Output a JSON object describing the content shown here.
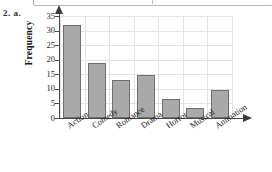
{
  "problem_label": "2. a.",
  "chart_data": {
    "type": "bar",
    "title": "",
    "xlabel": "",
    "ylabel": "Frequency",
    "categories": [
      "Action",
      "Comedy",
      "Romance",
      "Drama",
      "Horror",
      "Musical",
      "Animation"
    ],
    "values": [
      32,
      19,
      13,
      14.8,
      6.5,
      3.5,
      9.6
    ],
    "ylim": [
      0,
      35
    ],
    "ytick_labels": [
      "0",
      "5",
      "10",
      "15",
      "20",
      "25",
      "30",
      "35"
    ],
    "ytick_values": [
      0,
      5,
      10,
      15,
      20,
      25,
      30,
      35
    ],
    "grid": true,
    "legend": "none",
    "bar_fill": "#a9a9a9",
    "bar_border": "#6f6f6f",
    "axis_color": "#4a4a4a",
    "grid_color": "#e2e2e2"
  }
}
